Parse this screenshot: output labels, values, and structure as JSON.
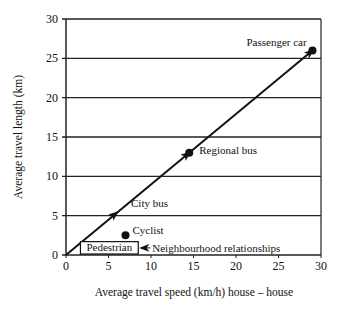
{
  "chart_data": {
    "type": "line",
    "title": "",
    "xlabel": "Average travel speed (km/h) house – house",
    "ylabel": "Average travel length (km)",
    "xlim": [
      0,
      30
    ],
    "ylim": [
      0,
      30
    ],
    "x_ticks": [
      "0",
      "5",
      "10",
      "15",
      "20",
      "25",
      "30"
    ],
    "y_ticks": [
      "0",
      "5",
      "10",
      "15",
      "20",
      "25",
      "30"
    ],
    "grid": "horizontal",
    "series": [
      {
        "name": "Mode trend line",
        "x": [
          0,
          29
        ],
        "y": [
          0,
          26
        ],
        "arrows_at": [
          [
            6,
            5.4
          ],
          [
            14.5,
            13
          ],
          [
            29,
            26
          ]
        ]
      }
    ],
    "points": [
      {
        "label": "Passenger car",
        "x": 29,
        "y": 26
      },
      {
        "label": "Regional bus",
        "x": 14.5,
        "y": 13
      },
      {
        "label": "City bus",
        "x": 6,
        "y": 5.4,
        "marker": "arrow"
      },
      {
        "label": "Cyclist",
        "x": 7,
        "y": 2.5
      }
    ],
    "annotations": [
      {
        "text": "Pedestrian",
        "type": "box",
        "x_range": [
          1.7,
          8.5
        ],
        "y_range": [
          0,
          1.7
        ]
      },
      {
        "text": "Neighbourhood relationships",
        "type": "arrow-label",
        "points_to": "Pedestrian"
      }
    ],
    "legend": "none"
  }
}
